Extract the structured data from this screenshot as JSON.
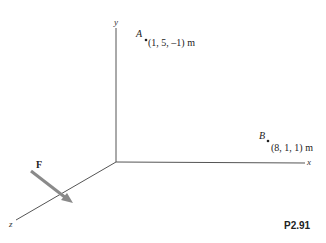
{
  "figure": {
    "id": "P2.91",
    "axes": {
      "x_label": "x",
      "y_label": "y",
      "z_label": "z"
    },
    "points": [
      {
        "name": "A",
        "coords": "(1, 5, –1) m"
      },
      {
        "name": "B",
        "coords": "(8, 1, 1) m"
      }
    ],
    "force": {
      "label": "F"
    },
    "colors": {
      "axis": "#555555",
      "arrow": "#8a8a8a",
      "text": "#222222"
    }
  }
}
